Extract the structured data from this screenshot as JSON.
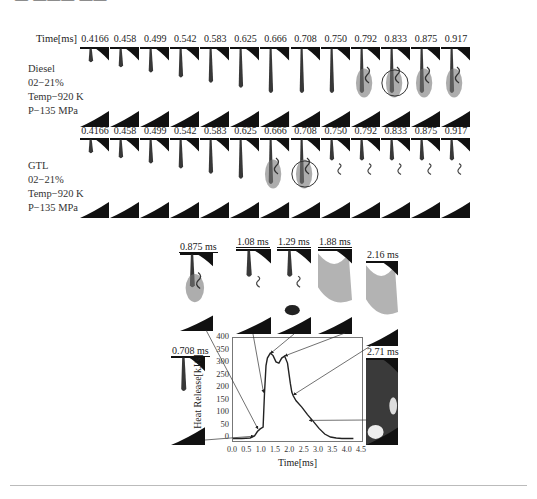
{
  "header": {
    "cut_text": "— ——— —— ·"
  },
  "top_strip": {
    "time_header": "Time[ms]",
    "times": [
      "0.4166",
      "0.458",
      "0.499",
      "0.542",
      "0.583",
      "0.625",
      "0.666",
      "0.708",
      "0.750",
      "0.792",
      "0.833",
      "0.875",
      "0.917"
    ],
    "diesel": {
      "label_lines": [
        "Diesel",
        "02−21%",
        "Temp−920 K",
        "P−135 MPa"
      ],
      "circled_time": "0.833"
    },
    "gtl": {
      "label_lines": [
        "GTL",
        "02−21%",
        "Temp−920 K",
        "P−135 MPa"
      ],
      "circled_time": "0.708"
    }
  },
  "insets": {
    "t0708": "0.708 ms",
    "t0875": "0.875 ms",
    "t108": "1.08 ms",
    "t129": "1.29 ms",
    "t188": "1.88 ms",
    "t216": "2.16 ms",
    "t271": "2.71 ms"
  },
  "chart_data": {
    "type": "line",
    "title": "",
    "xlabel": "Time[ms]",
    "ylabel": "Heat Release[kJ/s]",
    "xlim": [
      0,
      4.5
    ],
    "ylim": [
      -10,
      400
    ],
    "xticks": [
      "0.0",
      "0.5",
      "1.0",
      "1.5",
      "2.0",
      "2.5",
      "3.0",
      "3.5",
      "4.0",
      "4.5"
    ],
    "yticks": [
      "0",
      "50",
      "100",
      "150",
      "200",
      "250",
      "300",
      "350",
      "400"
    ],
    "grid": false,
    "series": [
      {
        "name": "Heat release rate",
        "x": [
          0.0,
          0.3,
          0.6,
          0.75,
          0.85,
          0.95,
          1.05,
          1.1,
          1.15,
          1.2,
          1.3,
          1.4,
          1.5,
          1.6,
          1.7,
          1.8,
          1.9,
          2.0,
          2.05,
          2.1,
          2.2,
          2.4,
          2.6,
          2.8,
          3.0,
          3.2,
          3.4,
          3.6,
          3.8,
          4.0,
          4.2
        ],
        "y": [
          0,
          0,
          2,
          10,
          28,
          38,
          45,
          180,
          290,
          320,
          340,
          330,
          305,
          300,
          320,
          328,
          300,
          220,
          185,
          170,
          150,
          125,
          95,
          68,
          40,
          18,
          6,
          2,
          0,
          0,
          0
        ]
      }
    ],
    "annotations": [
      {
        "label": "0.708 ms",
        "points_to_x": 0.75,
        "points_to_y": 5
      },
      {
        "label": "0.875 ms",
        "points_to_x": 0.9,
        "points_to_y": 35
      },
      {
        "label": "1.08 ms",
        "points_to_x": 1.1,
        "points_to_y": 180
      },
      {
        "label": "1.29 ms",
        "points_to_x": 1.35,
        "points_to_y": 335
      },
      {
        "label": "1.88 ms",
        "points_to_x": 1.85,
        "points_to_y": 325
      },
      {
        "label": "2.16 ms",
        "points_to_x": 2.15,
        "points_to_y": 170
      },
      {
        "label": "2.71 ms",
        "points_to_x": 2.7,
        "points_to_y": 68
      }
    ]
  }
}
